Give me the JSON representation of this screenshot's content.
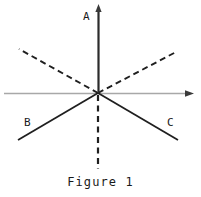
{
  "figure": {
    "caption": "Figure 1",
    "width": 201,
    "height": 197,
    "background_color": "#ffffff",
    "origin": {
      "x": 98,
      "y": 93
    },
    "labels": {
      "a": "A",
      "b": "B",
      "c": "C"
    },
    "colors": {
      "vertical_axis": "#2b2b2b",
      "horizontal_axis": "#a8a8a8",
      "solid_rays": "#1f1f1f",
      "dashed_rays": "#1f1f1f",
      "text": "#1a1a1a"
    },
    "elements": [
      {
        "name": "vertical-axis-up",
        "kind": "arrow",
        "style": "solid",
        "from": {
          "x": 98,
          "y": 93
        },
        "to": {
          "x": 98,
          "y": 5
        },
        "color": "#2b2b2b",
        "width": 2.1,
        "label": "A"
      },
      {
        "name": "horizontal-axis",
        "kind": "arrow",
        "style": "solid",
        "from": {
          "x": 4,
          "y": 93
        },
        "to": {
          "x": 193,
          "y": 93
        },
        "color": "#a8a8a8",
        "width": 1.6,
        "label": ""
      },
      {
        "name": "ray-b",
        "kind": "line",
        "style": "solid",
        "from": {
          "x": 98,
          "y": 93
        },
        "to": {
          "x": 18,
          "y": 140
        },
        "color": "#1f1f1f",
        "width": 1.7,
        "label": "B"
      },
      {
        "name": "ray-c",
        "kind": "line",
        "style": "solid",
        "from": {
          "x": 98,
          "y": 93
        },
        "to": {
          "x": 178,
          "y": 140
        },
        "color": "#1f1f1f",
        "width": 1.7,
        "label": "C"
      },
      {
        "name": "dashed-ray-upper-left",
        "kind": "line",
        "style": "dashed",
        "from": {
          "x": 98,
          "y": 93
        },
        "to": {
          "x": 19,
          "y": 49
        },
        "color": "#1f1f1f",
        "width": 1.8,
        "dash": "6,4",
        "label": ""
      },
      {
        "name": "dashed-ray-upper-right",
        "kind": "line",
        "style": "dashed",
        "from": {
          "x": 98,
          "y": 93
        },
        "to": {
          "x": 176,
          "y": 52
        },
        "color": "#1f1f1f",
        "width": 1.8,
        "dash": "6,4",
        "label": ""
      },
      {
        "name": "dashed-ray-down",
        "kind": "line",
        "style": "dashed",
        "from": {
          "x": 98,
          "y": 93
        },
        "to": {
          "x": 98,
          "y": 169
        },
        "color": "#1f1f1f",
        "width": 2.0,
        "dash": "6,4",
        "label": ""
      }
    ]
  }
}
